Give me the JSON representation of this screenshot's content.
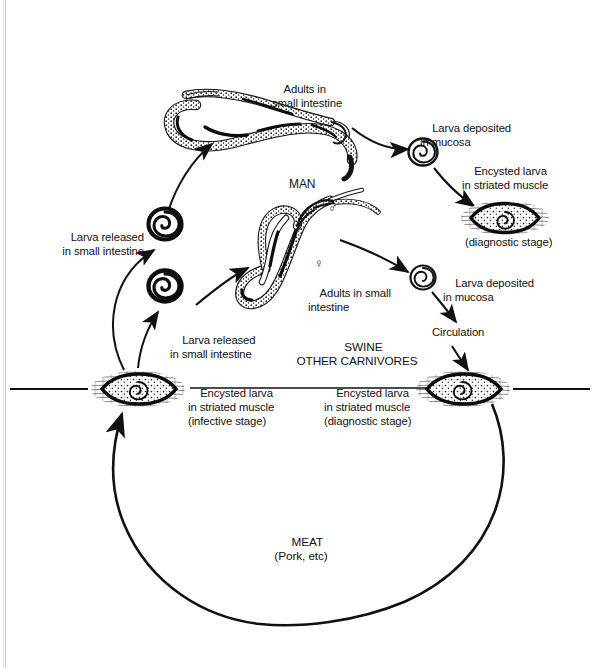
{
  "figure": {
    "background_color": "#ffffff",
    "ink_color": "#111111"
  },
  "labels": {
    "adults_small_intestine_man": "Adults in\nsmall intestine",
    "larva_deposited_mucosa_top": "Larva deposited\nin mucosa",
    "encysted_larva_striated_muscle_top": "Encysted larva\nin striated muscle",
    "diagnostic_stage_top": "(diagnostic stage)",
    "man": "MAN",
    "male_symbol": "♂",
    "female_symbol": "♀",
    "larva_released_small_intestine_upper": "Larva released\nin small intestine",
    "larva_released_small_intestine_lower": "Larva released\nin small intestine",
    "adults_small_intestine_swine": "Adults in small\nintestine",
    "swine_other_carnivores": "SWINE\nOTHER CARNIVORES",
    "larva_deposited_mucosa_right": "Larva deposited\nin mucosa",
    "circulation": "Circulation",
    "encysted_larva_infective": "Encysted larva\nin striated muscle\n(infective stage)",
    "encysted_larva_diagnostic": "Encysted larva\nin striated muscle\n(diagnostic stage)",
    "meat": "MEAT\n(Pork, etc)"
  },
  "icons": {
    "adult_worms_man": "adult-nematode-worms-icon",
    "adult_worms_swine": "adult-nematode-worms-icon",
    "coiled_larva": "coiled-larva-icon",
    "encysted_larva_muscle": "encysted-larva-in-muscle-icon",
    "arrow": "arrow-icon"
  },
  "stages": [
    {
      "id": "adults-man",
      "label": "Adults in small intestine",
      "host": "MAN"
    },
    {
      "id": "larva-deposited-mucosa-man",
      "label": "Larva deposited in mucosa",
      "host": "MAN"
    },
    {
      "id": "encysted-larva-muscle-man",
      "label": "Encysted larva in striated muscle",
      "stage_note": "(diagnostic stage)",
      "host": "MAN"
    },
    {
      "id": "larva-released-man",
      "label": "Larva released in small intestine",
      "host": "MAN"
    },
    {
      "id": "larva-released-swine",
      "label": "Larva released in small intestine",
      "host": "SWINE / OTHER CARNIVORES"
    },
    {
      "id": "adults-swine",
      "label": "Adults in small intestine",
      "host": "SWINE / OTHER CARNIVORES"
    },
    {
      "id": "larva-deposited-mucosa-swine",
      "label": "Larva deposited in mucosa",
      "host": "SWINE / OTHER CARNIVORES"
    },
    {
      "id": "circulation",
      "label": "Circulation",
      "host": "SWINE / OTHER CARNIVORES"
    },
    {
      "id": "encysted-larva-diagnostic",
      "label": "Encysted larva in striated muscle",
      "stage_note": "(diagnostic stage)",
      "host": "SWINE / OTHER CARNIVORES"
    },
    {
      "id": "encysted-larva-infective",
      "label": "Encysted larva in striated muscle",
      "stage_note": "(infective stage)",
      "host": "MEAT"
    },
    {
      "id": "meat",
      "label": "MEAT",
      "stage_note": "(Pork, etc)"
    }
  ]
}
